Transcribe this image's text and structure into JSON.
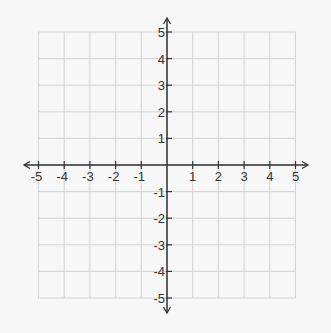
{
  "chart_data": {
    "type": "scatter",
    "title": "",
    "xlabel": "",
    "ylabel": "",
    "xlim": [
      -5,
      5
    ],
    "ylim": [
      -5,
      5
    ],
    "grid": true,
    "x_ticks": [
      -5,
      -4,
      -3,
      -2,
      -1,
      1,
      2,
      3,
      4,
      5
    ],
    "y_ticks": [
      5,
      4,
      3,
      2,
      1,
      -1,
      -2,
      -3,
      -4,
      -5
    ],
    "x_tick_labels": [
      "-5",
      "-4",
      "-3",
      "-2",
      "-1",
      "1",
      "2",
      "3",
      "4",
      "5"
    ],
    "y_tick_labels": [
      "5",
      "4",
      "3",
      "2",
      "1",
      "-1",
      "-2",
      "-3",
      "-4",
      "-5"
    ],
    "series": [],
    "axes_arrows": true
  },
  "style": {
    "background": "#f7f7f7",
    "grid_color": "#d2d2d2",
    "axis_color": "#333333",
    "label_color": "#333333"
  },
  "layout": {
    "origin_x": 167,
    "origin_y": 165,
    "unit_x": 25.7,
    "unit_y": 26.6,
    "x_axis_start": 24,
    "x_axis_end": 308,
    "y_axis_start": 18,
    "y_axis_end": 313
  }
}
